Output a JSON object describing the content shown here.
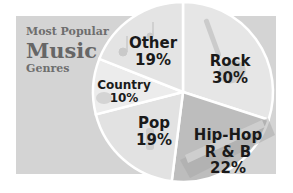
{
  "title": {
    "line1": "Most Popular",
    "line2": "Music",
    "line3": "Genres"
  },
  "colors": {
    "banner": "#d4d4d4",
    "rock": "#e6e6e6",
    "hiphop": "#bdbdbd",
    "pop": "#e2e2e2",
    "country": "#ececec",
    "other": "#e4e4e4",
    "divider": "#ffffff",
    "label": "#1a1a1a",
    "title": "#6e6e6e"
  },
  "slices": [
    {
      "name": "Rock",
      "value_label": "30%"
    },
    {
      "name": "Hip-Hop",
      "name2": "R & B",
      "value_label": "22%"
    },
    {
      "name": "Pop",
      "value_label": "19%"
    },
    {
      "name": "Country",
      "value_label": "10%"
    },
    {
      "name": "Other",
      "value_label": "19%"
    }
  ],
  "chart_data": {
    "type": "pie",
    "title": "Most Popular Music Genres",
    "categories": [
      "Rock",
      "Hip-Hop R & B",
      "Pop",
      "Country",
      "Other"
    ],
    "values": [
      30,
      22,
      19,
      10,
      19
    ],
    "unit": "%",
    "start_angle_deg": 0,
    "direction": "clockwise",
    "legend": "none (labels inside slices)",
    "icons": [
      "guitar-icon",
      "keyboard-icon",
      "microphone-icon",
      "cowboy-hat-icon",
      "music-notes-icon"
    ]
  }
}
